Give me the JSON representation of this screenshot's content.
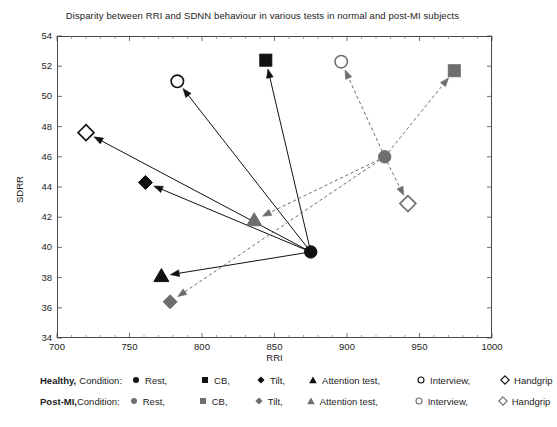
{
  "chart": {
    "title": "Disparity between RRI and SDNN behaviour in various tests in normal and post-MI subjects",
    "xlabel": "RRI",
    "ylabel": "SDRR"
  },
  "axes": {
    "x_ticks": [
      "700",
      "750",
      "800",
      "850",
      "900",
      "950",
      "1000"
    ],
    "y_ticks": [
      "54",
      "52",
      "50",
      "48",
      "46",
      "44",
      "42",
      "40",
      "38",
      "36",
      "34"
    ]
  },
  "legend": {
    "row1": {
      "group": "Healthy,",
      "condition": "Condition:",
      "items": [
        {
          "label": "Rest,",
          "marker": "filled-circle-icon"
        },
        {
          "label": "CB,",
          "marker": "filled-square-icon"
        },
        {
          "label": "Tilt,",
          "marker": "filled-diamond-icon"
        },
        {
          "label": "Attention test,",
          "marker": "filled-triangle-icon"
        },
        {
          "label": "Interview,",
          "marker": "open-circle-icon"
        },
        {
          "label": "Handgrip",
          "marker": "open-diamond-icon"
        }
      ]
    },
    "row2": {
      "group": "Post-MI,",
      "condition": "Condition:",
      "items": [
        {
          "label": "Rest,",
          "marker": "filled-circle-icon"
        },
        {
          "label": "CB,",
          "marker": "filled-square-icon"
        },
        {
          "label": "Tilt,",
          "marker": "filled-diamond-icon"
        },
        {
          "label": "Attention test,",
          "marker": "filled-triangle-icon"
        },
        {
          "label": "Interview,",
          "marker": "open-circle-icon"
        },
        {
          "label": "Handgrip",
          "marker": "open-diamond-icon"
        }
      ]
    }
  },
  "colors": {
    "healthy": "#111111",
    "post_mi": "#6e6e6e",
    "axis": "#4a4a4a",
    "background": "#ffffff"
  },
  "chart_data": {
    "type": "scatter",
    "title": "Disparity between RRI and SDNN behaviour in various tests in normal and post-MI subjects",
    "xlabel": "RRI",
    "ylabel": "SDRR",
    "xlim": [
      700,
      1000
    ],
    "ylim": [
      34,
      54
    ],
    "xticks": [
      700,
      750,
      800,
      850,
      900,
      950,
      1000
    ],
    "yticks": [
      34,
      36,
      38,
      40,
      42,
      44,
      46,
      48,
      50,
      52,
      54
    ],
    "grid": false,
    "legend_position": "below-plot",
    "series": [
      {
        "name": "Healthy",
        "color": "#111111",
        "line_style": "solid",
        "origin": {
          "condition": "Rest",
          "marker": "filled-circle",
          "x": 875,
          "y": 39.7
        },
        "points": [
          {
            "condition": "Rest",
            "marker": "filled-circle",
            "x": 875,
            "y": 39.7
          },
          {
            "condition": "CB",
            "marker": "filled-square",
            "x": 844,
            "y": 52.4
          },
          {
            "condition": "Tilt",
            "marker": "filled-diamond",
            "x": 761,
            "y": 44.3
          },
          {
            "condition": "Attention test",
            "marker": "filled-triangle",
            "x": 772,
            "y": 38.1
          },
          {
            "condition": "Interview",
            "marker": "open-circle",
            "x": 783,
            "y": 51.0
          },
          {
            "condition": "Handgrip",
            "marker": "open-diamond",
            "x": 720,
            "y": 47.6
          }
        ],
        "arrows": [
          {
            "from": [
              875,
              39.7
            ],
            "to": [
              844,
              52.4
            ],
            "to_condition": "CB"
          },
          {
            "from": [
              875,
              39.7
            ],
            "to": [
              761,
              44.3
            ],
            "to_condition": "Tilt"
          },
          {
            "from": [
              875,
              39.7
            ],
            "to": [
              772,
              38.1
            ],
            "to_condition": "Attention test"
          },
          {
            "from": [
              875,
              39.7
            ],
            "to": [
              783,
              51.0
            ],
            "to_condition": "Interview"
          },
          {
            "from": [
              875,
              39.7
            ],
            "to": [
              720,
              47.6
            ],
            "to_condition": "Handgrip"
          }
        ]
      },
      {
        "name": "Post-MI",
        "color": "#6e6e6e",
        "line_style": "dashed",
        "origin": {
          "condition": "Rest",
          "marker": "filled-circle",
          "x": 926,
          "y": 46.0
        },
        "points": [
          {
            "condition": "Rest",
            "marker": "filled-circle",
            "x": 926,
            "y": 46.0
          },
          {
            "condition": "CB",
            "marker": "filled-square",
            "x": 974,
            "y": 51.7
          },
          {
            "condition": "Tilt",
            "marker": "filled-diamond",
            "x": 778,
            "y": 36.4
          },
          {
            "condition": "Attention test",
            "marker": "filled-triangle",
            "x": 836,
            "y": 41.8
          },
          {
            "condition": "Interview",
            "marker": "open-circle",
            "x": 896,
            "y": 52.3
          },
          {
            "condition": "Handgrip",
            "marker": "open-diamond",
            "x": 942,
            "y": 42.9
          }
        ],
        "arrows": [
          {
            "from": [
              926,
              46.0
            ],
            "to": [
              974,
              51.7
            ],
            "to_condition": "CB"
          },
          {
            "from": [
              926,
              46.0
            ],
            "to": [
              778,
              36.4
            ],
            "to_condition": "Tilt"
          },
          {
            "from": [
              926,
              46.0
            ],
            "to": [
              836,
              41.8
            ],
            "to_condition": "Attention test"
          },
          {
            "from": [
              926,
              46.0
            ],
            "to": [
              896,
              52.3
            ],
            "to_condition": "Interview"
          },
          {
            "from": [
              926,
              46.0
            ],
            "to": [
              942,
              42.9
            ],
            "to_condition": "Handgrip"
          }
        ]
      }
    ]
  }
}
